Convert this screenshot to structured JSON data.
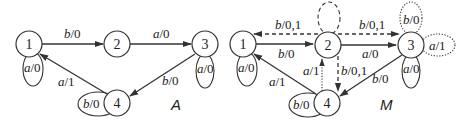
{
  "diagrams": [
    {
      "id": "A",
      "label": "A",
      "nodes": [
        {
          "id": "1",
          "label": "1",
          "x": 29,
          "y": 44
        },
        {
          "id": "2",
          "label": "2",
          "x": 117,
          "y": 44
        },
        {
          "id": "3",
          "label": "3",
          "x": 205,
          "y": 44
        },
        {
          "id": "4",
          "label": "4",
          "x": 117,
          "y": 103
        }
      ],
      "edges": [
        {
          "from": "1",
          "to": "2",
          "style": "solid",
          "label_in": "b",
          "label_out": "0"
        },
        {
          "from": "2",
          "to": "3",
          "style": "solid",
          "label_in": "a",
          "label_out": "0"
        },
        {
          "from": "3",
          "to": "4",
          "style": "solid",
          "label_in": "b",
          "label_out": "0"
        },
        {
          "from": "4",
          "to": "1",
          "style": "solid",
          "label_in": "a",
          "label_out": "1"
        },
        {
          "from": "1",
          "to": "1",
          "style": "solid",
          "position": "below",
          "label_in": "a",
          "label_out": "0"
        },
        {
          "from": "3",
          "to": "3",
          "style": "solid",
          "position": "below",
          "label_in": "a",
          "label_out": "0"
        },
        {
          "from": "4",
          "to": "4",
          "style": "solid",
          "position": "left",
          "label_in": "b",
          "label_out": "0"
        }
      ]
    },
    {
      "id": "M",
      "label": "M",
      "nodes": [
        {
          "id": "1",
          "label": "1",
          "x": 243,
          "y": 44
        },
        {
          "id": "2",
          "label": "2",
          "x": 328,
          "y": 45
        },
        {
          "id": "3",
          "label": "3",
          "x": 411,
          "y": 45
        },
        {
          "id": "4",
          "label": "4",
          "x": 327,
          "y": 103
        }
      ],
      "edges": [
        {
          "from": "1",
          "to": "2",
          "style": "solid",
          "label_in": "b",
          "label_out": "0"
        },
        {
          "from": "2",
          "to": "1",
          "style": "dashed",
          "label_in": "b",
          "label_out": "0,1"
        },
        {
          "from": "2",
          "to": "3",
          "style": "solid",
          "label_in": "a",
          "label_out": "0"
        },
        {
          "from": "2",
          "to": "3",
          "style": "dashed",
          "label_in": "b",
          "label_out": "0,1"
        },
        {
          "from": "2",
          "to": "4",
          "style": "dashed",
          "label_in": "b",
          "label_out": "0,1"
        },
        {
          "from": "4",
          "to": "2",
          "style": "dotted",
          "label_in": "a",
          "label_out": "1"
        },
        {
          "from": "3",
          "to": "4",
          "style": "solid",
          "label_in": "b",
          "label_out": "0"
        },
        {
          "from": "4",
          "to": "1",
          "style": "solid",
          "label_in": "a",
          "label_out": "1"
        },
        {
          "from": "1",
          "to": "1",
          "style": "solid",
          "position": "below",
          "label_in": "a",
          "label_out": "0"
        },
        {
          "from": "2",
          "to": "2",
          "style": "dashed",
          "position": "above",
          "label_in": "",
          "label_out": ""
        },
        {
          "from": "3",
          "to": "3",
          "style": "dotted",
          "position": "above",
          "label_in": "b",
          "label_out": "0"
        },
        {
          "from": "3",
          "to": "3",
          "style": "dotted",
          "position": "right",
          "label_in": "a",
          "label_out": "1"
        },
        {
          "from": "3",
          "to": "3",
          "style": "solid",
          "position": "below",
          "label_in": "a",
          "label_out": "0"
        },
        {
          "from": "4",
          "to": "4",
          "style": "solid",
          "position": "left",
          "label_in": "b",
          "label_out": "0"
        }
      ]
    }
  ],
  "text": {
    "A_title": "A",
    "M_title": "M",
    "A_n1": "1",
    "A_n2": "2",
    "A_n3": "3",
    "A_n4": "4",
    "M_n1": "1",
    "M_n2": "2",
    "M_n3": "3",
    "M_n4": "4",
    "A_e12": [
      "b",
      "/0"
    ],
    "A_e23": [
      "a",
      "/0"
    ],
    "A_e34": [
      "b",
      "/0"
    ],
    "A_e41": [
      "a",
      "/1"
    ],
    "A_l1": [
      "a",
      "/0"
    ],
    "A_l3": [
      "a",
      "/0"
    ],
    "A_l4": [
      "b",
      "/0"
    ],
    "M_e12": [
      "b",
      "/0"
    ],
    "M_e21": [
      "b",
      "/0,1"
    ],
    "M_e23": [
      "a",
      "/0"
    ],
    "M_e23d": [
      "b",
      "/0,1"
    ],
    "M_e24": [
      "b",
      "/0,1"
    ],
    "M_e42": [
      "a",
      "/1"
    ],
    "M_e34": [
      "b",
      "/0"
    ],
    "M_e41": [
      "a",
      "/1"
    ],
    "M_l1": [
      "a",
      "/0"
    ],
    "M_l3top": [
      "b",
      "/0"
    ],
    "M_l3right": [
      "a",
      "/1"
    ],
    "M_l3bottom": [
      "a",
      "/0"
    ],
    "M_l4": [
      "b",
      "/0"
    ]
  }
}
